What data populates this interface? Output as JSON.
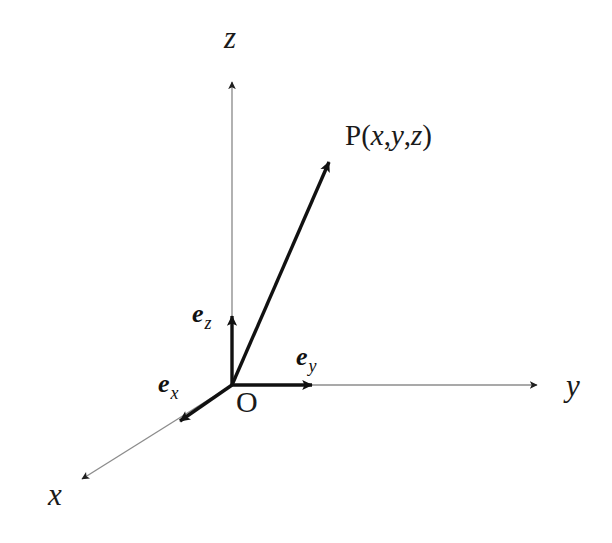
{
  "figure": {
    "background_color": "#ffffff",
    "ink_color": "#1a1a1a",
    "thin_axis_color": "#8c8c8c",
    "bold_vector_color": "#111111"
  },
  "axes": [
    {
      "id": "x-axis",
      "label": "x",
      "label_x": 48,
      "label_y": 505,
      "direction": "down-left",
      "line": {
        "x1": 232,
        "y1": 385,
        "x2": 79,
        "y2": 481
      },
      "arrow_tip": {
        "x": 73,
        "y": 485
      },
      "style": "thin"
    },
    {
      "id": "y-axis",
      "label": "y",
      "label_x": 566,
      "label_y": 396,
      "direction": "right",
      "line": {
        "x1": 232,
        "y1": 385,
        "x2": 539,
        "y2": 385
      },
      "arrow_tip": {
        "x": 546,
        "y": 385
      },
      "style": "thin"
    },
    {
      "id": "z-axis",
      "label": "z",
      "label_x": 224,
      "label_y": 48,
      "direction": "up",
      "line": {
        "x1": 232,
        "y1": 385,
        "x2": 232,
        "y2": 79
      },
      "arrow_tip": {
        "x": 232,
        "y": 72
      },
      "style": "thin"
    }
  ],
  "basis_vectors": [
    {
      "id": "e-x",
      "symbol": "e",
      "subscript": "x",
      "label_x": 158,
      "label_y": 392,
      "line": {
        "x1": 232,
        "y1": 385,
        "x2": 177,
        "y2": 423
      },
      "arrow_tip": {
        "x": 170,
        "y": 428
      },
      "style": "bold"
    },
    {
      "id": "e-y",
      "symbol": "e",
      "subscript": "y",
      "label_x": 296,
      "label_y": 365,
      "line": {
        "x1": 232,
        "y1": 385,
        "x2": 315,
        "y2": 385
      },
      "arrow_tip": {
        "x": 323,
        "y": 385
      },
      "style": "bold"
    },
    {
      "id": "e-z",
      "symbol": "e",
      "subscript": "z",
      "label_x": 192,
      "label_y": 322,
      "line": {
        "x1": 232,
        "y1": 385,
        "x2": 232,
        "y2": 313
      },
      "arrow_tip": {
        "x": 232,
        "y": 305
      },
      "style": "bold"
    }
  ],
  "position_vector": {
    "id": "op-vector",
    "from": "O",
    "to": "P",
    "line": {
      "x1": 232,
      "y1": 385,
      "x2": 331,
      "y2": 158
    },
    "arrow_tip": {
      "x": 337,
      "y": 148
    },
    "style": "bold"
  },
  "points": {
    "origin": {
      "label": "O",
      "x": 236,
      "y": 412,
      "coords": {
        "x": 232,
        "y": 385
      }
    },
    "p": {
      "label_prefix": "P",
      "label_open": "(",
      "label_x": "x",
      "label_comma1": ",",
      "label_y": "y",
      "label_comma2": ",",
      "label_z": "z",
      "label_close": ")",
      "full_label": "P(x,y,z)",
      "label_pos_x": 345,
      "label_pos_y": 145
    }
  }
}
